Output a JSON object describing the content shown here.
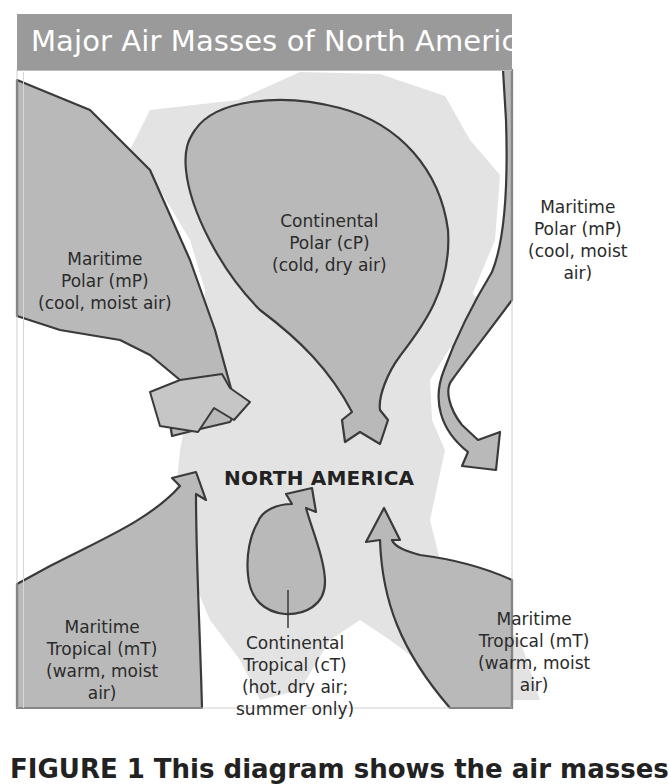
{
  "figure": {
    "title": "Major Air Masses of North America",
    "center_label": "NORTH AMERICA",
    "caption_visible": "FIGURE 1  This diagram shows the air masses"
  },
  "air_masses": [
    {
      "id": "mP-pacific",
      "lines": [
        "Maritime",
        "Polar (mP)",
        "(cool, moist air)"
      ]
    },
    {
      "id": "cP",
      "lines": [
        "Continental",
        "Polar (cP)",
        "(cold, dry air)"
      ]
    },
    {
      "id": "mP-atlantic",
      "lines": [
        "Maritime",
        "Polar (mP)",
        "(cool, moist",
        "air)"
      ]
    },
    {
      "id": "mT-pacific",
      "lines": [
        "Maritime",
        "Tropical (mT)",
        "(warm, moist",
        "air)"
      ]
    },
    {
      "id": "cT",
      "lines": [
        "Continental",
        "Tropical (cT)",
        "(hot, dry air;",
        "summer only)"
      ]
    },
    {
      "id": "mT-gulf",
      "lines": [
        "Maritime",
        "Tropical (mT)",
        "(warm, moist",
        "air)"
      ]
    }
  ],
  "colors": {
    "title_bar": "#9a9a9a",
    "air_mass_fill": "#b9b9b9",
    "arrow_fill": "#c6c6c6",
    "land": "#e3e3e3",
    "outline": "#3a3a3a"
  }
}
